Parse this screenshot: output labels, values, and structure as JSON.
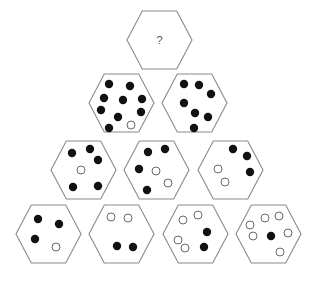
{
  "puzzle": {
    "type": "hexagon dot pyramid",
    "colors": {
      "outline": "#8a8a8a",
      "filled_dot": "#111111",
      "open_dot": "#ffffff",
      "background": "#ffffff"
    },
    "hex_size": {
      "width": 65,
      "height": 58
    },
    "question_mark": "?",
    "hexagons": [
      {
        "id": "row1-hex1",
        "row": 1,
        "x": 127,
        "y": 11,
        "label": "?",
        "filled_count": null,
        "open_count": null,
        "dots": []
      },
      {
        "id": "row2-hex1",
        "row": 2,
        "x": 89,
        "y": 74,
        "filled_count": 9,
        "open_count": 1,
        "dots": [
          {
            "x": 109,
            "y": 84,
            "filled": true
          },
          {
            "x": 130,
            "y": 86,
            "filled": true
          },
          {
            "x": 104,
            "y": 98,
            "filled": true
          },
          {
            "x": 123,
            "y": 100,
            "filled": true
          },
          {
            "x": 142,
            "y": 99,
            "filled": true
          },
          {
            "x": 101,
            "y": 110,
            "filled": true
          },
          {
            "x": 141,
            "y": 112,
            "filled": true
          },
          {
            "x": 118,
            "y": 117,
            "filled": true
          },
          {
            "x": 109,
            "y": 128,
            "filled": true
          },
          {
            "x": 131,
            "y": 125,
            "filled": false
          }
        ]
      },
      {
        "id": "row2-hex2",
        "row": 2,
        "x": 162,
        "y": 74,
        "filled_count": 7,
        "open_count": 0,
        "dots": [
          {
            "x": 184,
            "y": 84,
            "filled": true
          },
          {
            "x": 199,
            "y": 85,
            "filled": true
          },
          {
            "x": 211,
            "y": 94,
            "filled": true
          },
          {
            "x": 184,
            "y": 103,
            "filled": true
          },
          {
            "x": 195,
            "y": 113,
            "filled": true
          },
          {
            "x": 208,
            "y": 117,
            "filled": true
          },
          {
            "x": 194,
            "y": 128,
            "filled": true
          }
        ]
      },
      {
        "id": "row3-hex1",
        "row": 3,
        "x": 51,
        "y": 141,
        "filled_count": 5,
        "open_count": 1,
        "dots": [
          {
            "x": 72,
            "y": 153,
            "filled": true
          },
          {
            "x": 90,
            "y": 149,
            "filled": true
          },
          {
            "x": 98,
            "y": 160,
            "filled": true
          },
          {
            "x": 81,
            "y": 170,
            "filled": false
          },
          {
            "x": 73,
            "y": 187,
            "filled": true
          },
          {
            "x": 98,
            "y": 186,
            "filled": true
          }
        ]
      },
      {
        "id": "row3-hex2",
        "row": 3,
        "x": 124,
        "y": 141,
        "filled_count": 4,
        "open_count": 2,
        "dots": [
          {
            "x": 148,
            "y": 152,
            "filled": true
          },
          {
            "x": 165,
            "y": 149,
            "filled": true
          },
          {
            "x": 139,
            "y": 169,
            "filled": true
          },
          {
            "x": 156,
            "y": 171,
            "filled": false
          },
          {
            "x": 168,
            "y": 183,
            "filled": false
          },
          {
            "x": 147,
            "y": 190,
            "filled": true
          }
        ]
      },
      {
        "id": "row3-hex3",
        "row": 3,
        "x": 198,
        "y": 141,
        "filled_count": 3,
        "open_count": 2,
        "dots": [
          {
            "x": 233,
            "y": 149,
            "filled": true
          },
          {
            "x": 247,
            "y": 156,
            "filled": true
          },
          {
            "x": 250,
            "y": 172,
            "filled": true
          },
          {
            "x": 218,
            "y": 169,
            "filled": false
          },
          {
            "x": 225,
            "y": 182,
            "filled": false
          }
        ]
      },
      {
        "id": "row4-hex1",
        "row": 4,
        "x": 16,
        "y": 205,
        "filled_count": 3,
        "open_count": 1,
        "dots": [
          {
            "x": 38,
            "y": 219,
            "filled": true
          },
          {
            "x": 59,
            "y": 224,
            "filled": true
          },
          {
            "x": 35,
            "y": 239,
            "filled": true
          },
          {
            "x": 56,
            "y": 247,
            "filled": false
          }
        ]
      },
      {
        "id": "row4-hex2",
        "row": 4,
        "x": 89,
        "y": 205,
        "filled_count": 2,
        "open_count": 2,
        "dots": [
          {
            "x": 111,
            "y": 217,
            "filled": false
          },
          {
            "x": 128,
            "y": 218,
            "filled": false
          },
          {
            "x": 117,
            "y": 246,
            "filled": true
          },
          {
            "x": 133,
            "y": 247,
            "filled": true
          }
        ]
      },
      {
        "id": "row4-hex3",
        "row": 4,
        "x": 163,
        "y": 205,
        "filled_count": 2,
        "open_count": 4,
        "dots": [
          {
            "x": 183,
            "y": 220,
            "filled": false
          },
          {
            "x": 198,
            "y": 215,
            "filled": false
          },
          {
            "x": 207,
            "y": 232,
            "filled": true
          },
          {
            "x": 178,
            "y": 240,
            "filled": false
          },
          {
            "x": 185,
            "y": 248,
            "filled": false
          },
          {
            "x": 204,
            "y": 247,
            "filled": true
          }
        ]
      },
      {
        "id": "row4-hex4",
        "row": 4,
        "x": 236,
        "y": 205,
        "filled_count": 1,
        "open_count": 6,
        "dots": [
          {
            "x": 265,
            "y": 218,
            "filled": false
          },
          {
            "x": 279,
            "y": 216,
            "filled": false
          },
          {
            "x": 250,
            "y": 225,
            "filled": false
          },
          {
            "x": 253,
            "y": 236,
            "filled": false
          },
          {
            "x": 271,
            "y": 236,
            "filled": true
          },
          {
            "x": 288,
            "y": 233,
            "filled": false
          },
          {
            "x": 280,
            "y": 252,
            "filled": false
          }
        ]
      }
    ]
  }
}
